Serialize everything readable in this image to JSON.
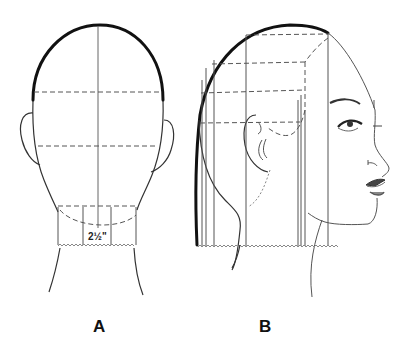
{
  "figure": {
    "type": "haircut-diagram",
    "panels": [
      {
        "id": "A",
        "label": "A",
        "view": "back of head",
        "measurement": "2½\"",
        "guides": {
          "center_vertical": true,
          "horizontal_dashed_partings": 2,
          "nape_section_verticals": 2,
          "nape_curve_dashed": true
        }
      },
      {
        "id": "B",
        "label": "B",
        "view": "side profile facing right",
        "guides": {
          "horizontal_dashed_partings": 3,
          "vertical_lines": 7,
          "behind_ear_dotted_curve": true,
          "cut_line_zigzag": true
        }
      }
    ]
  },
  "colors": {
    "background": "#ffffff",
    "ink": "#111111",
    "guide": "#555555"
  }
}
